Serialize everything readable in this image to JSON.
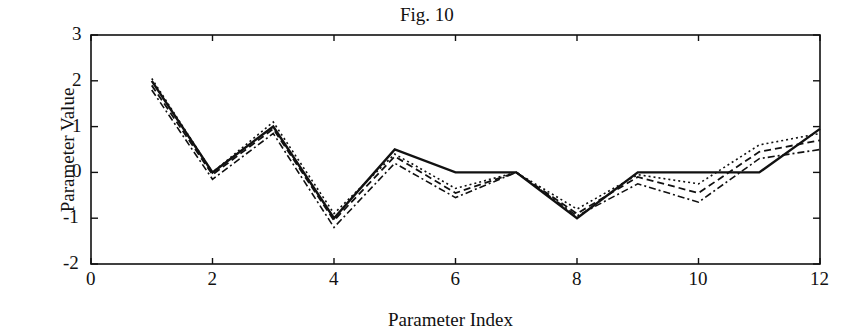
{
  "chart_data": {
    "type": "line",
    "title": "Fig. 10",
    "xlabel": "Parameter Index",
    "ylabel": "Parameter Value",
    "xlim": [
      0,
      12
    ],
    "ylim": [
      -2,
      3
    ],
    "xticks": [
      "0",
      "2",
      "4",
      "6",
      "8",
      "10",
      "12"
    ],
    "yticks": [
      "3",
      "2",
      "1",
      "0",
      "-1",
      "-2"
    ],
    "grid": false,
    "legend": null,
    "x": [
      1,
      2,
      3,
      4,
      5,
      6,
      7,
      8,
      9,
      10,
      11,
      12
    ],
    "series": [
      {
        "name": "solid",
        "style": "solid",
        "values": [
          2.0,
          0.0,
          1.0,
          -1.0,
          0.5,
          0.0,
          0.0,
          -1.0,
          0.0,
          0.0,
          0.0,
          0.95
        ]
      },
      {
        "name": "dashed",
        "style": "dashed",
        "values": [
          1.9,
          -0.05,
          0.95,
          -1.05,
          0.35,
          -0.45,
          0.0,
          -0.9,
          -0.1,
          -0.45,
          0.45,
          0.7
        ]
      },
      {
        "name": "dash-dot",
        "style": "dashdot",
        "values": [
          1.8,
          -0.15,
          0.85,
          -1.2,
          0.2,
          -0.55,
          0.0,
          -0.95,
          -0.25,
          -0.65,
          0.3,
          0.5
        ]
      },
      {
        "name": "dotted",
        "style": "dotted",
        "values": [
          2.05,
          0.0,
          1.1,
          -0.9,
          0.4,
          -0.35,
          0.0,
          -0.8,
          -0.05,
          -0.25,
          0.6,
          0.85
        ]
      }
    ]
  }
}
